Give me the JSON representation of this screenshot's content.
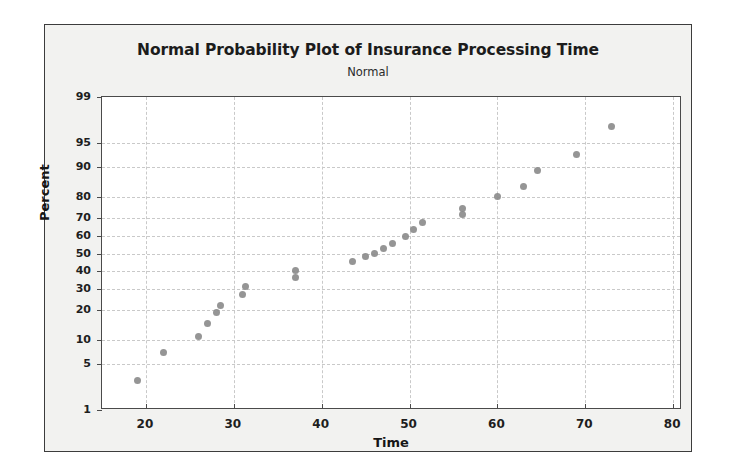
{
  "figure": {
    "title": "Normal Probability Plot of Insurance Processing Time",
    "subtitle": "Normal",
    "background_color": "#f2f2f0",
    "border_color": "#3c3c3c",
    "marker_color": "#8a8a8a",
    "grid_color": "#c9c9c9"
  },
  "chart_data": {
    "type": "scatter",
    "title": "Normal Probability Plot of Insurance Processing Time",
    "subtitle": "Normal",
    "xlabel": "Time",
    "ylabel": "Percent",
    "xlim": [
      15,
      81
    ],
    "ylim": [
      1,
      99
    ],
    "yscale": "normal-probability",
    "grid": true,
    "legend": null,
    "xticks": [
      20,
      30,
      40,
      50,
      60,
      70,
      80
    ],
    "yticks": [
      1,
      5,
      10,
      20,
      30,
      40,
      50,
      60,
      70,
      80,
      90,
      95,
      99
    ],
    "x": [
      19,
      22,
      26,
      27,
      28,
      28.5,
      31,
      31.3,
      37,
      37,
      43.5,
      45,
      46,
      47,
      48,
      49.5,
      50.5,
      51.5,
      56,
      56,
      60,
      63,
      64.5,
      69,
      73
    ],
    "y": [
      3,
      7,
      11,
      15,
      19,
      22,
      27,
      31,
      36,
      40,
      45,
      48,
      50,
      53,
      56,
      60,
      64,
      68,
      72,
      75,
      80,
      84,
      89,
      93,
      97
    ],
    "points": [
      {
        "time": 19,
        "percent": 3
      },
      {
        "time": 22,
        "percent": 7
      },
      {
        "time": 26,
        "percent": 11
      },
      {
        "time": 27,
        "percent": 15
      },
      {
        "time": 28,
        "percent": 19
      },
      {
        "time": 28.5,
        "percent": 22
      },
      {
        "time": 31,
        "percent": 27
      },
      {
        "time": 31.3,
        "percent": 31
      },
      {
        "time": 37,
        "percent": 36
      },
      {
        "time": 37,
        "percent": 40
      },
      {
        "time": 43.5,
        "percent": 45
      },
      {
        "time": 45,
        "percent": 48
      },
      {
        "time": 46,
        "percent": 50
      },
      {
        "time": 47,
        "percent": 53
      },
      {
        "time": 48,
        "percent": 56
      },
      {
        "time": 49.5,
        "percent": 60
      },
      {
        "time": 50.5,
        "percent": 64
      },
      {
        "time": 51.5,
        "percent": 68
      },
      {
        "time": 56,
        "percent": 72
      },
      {
        "time": 56,
        "percent": 75
      },
      {
        "time": 60,
        "percent": 80
      },
      {
        "time": 63,
        "percent": 84
      },
      {
        "time": 64.5,
        "percent": 89
      },
      {
        "time": 69,
        "percent": 93
      },
      {
        "time": 73,
        "percent": 97
      }
    ]
  }
}
